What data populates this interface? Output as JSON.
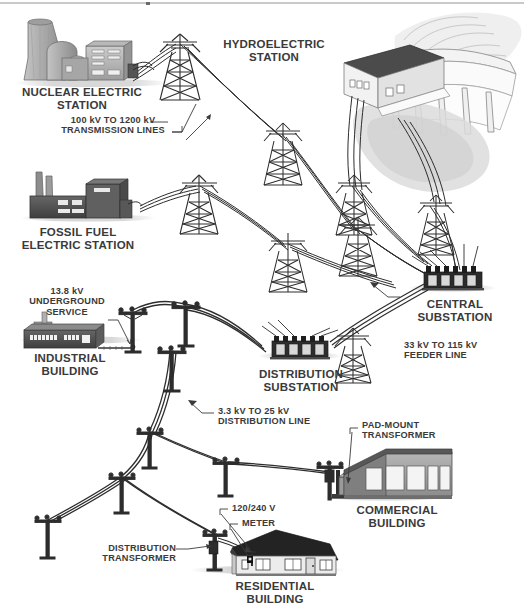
{
  "diagram": {
    "type": "schematic-illustration",
    "background_color": "#ffffff",
    "text_color": "#3a3a3a"
  },
  "labels": {
    "nuclear_station": "NUCLEAR ELECTRIC\nSTATION",
    "hydroelectric_station": "HYDROELECTRIC\nSTATION",
    "transmission_lines": "100 kV TO 1200 kV\nTRANSMISSION LINES",
    "fossil_fuel_station": "FOSSIL FUEL\nELECTRIC STATION",
    "underground_service": "13.8 kV\nUNDERGROUND\nSERVICE",
    "industrial_building": "INDUSTRIAL\nBUILDING",
    "central_substation": "CENTRAL\nSUBSTATION",
    "feeder_line": "33 kV TO 115 kV\nFEEDER LINE",
    "distribution_substation": "DISTRIBUTION\nSUBSTATION",
    "distribution_line": "3.3 kV TO 25 kV\nDISTRIBUTION LINE",
    "pad_mount_transformer": "PAD-MOUNT\nTRANSFORMER",
    "commercial_building": "COMMERCIAL\nBUILDING",
    "service_voltage": "120/240 V",
    "meter": "METER",
    "distribution_transformer": "DISTRIBUTION\nTRANSFORMER",
    "residential_building": "RESIDENTIAL\nBUILDING"
  },
  "voltages": [
    {
      "stage": "transmission",
      "range": "100 kV TO 1200 kV"
    },
    {
      "stage": "feeder",
      "range": "33 kV TO 115 kV"
    },
    {
      "stage": "distribution",
      "range": "3.3 kV TO 25 kV"
    },
    {
      "stage": "industrial-underground",
      "range": "13.8 kV"
    },
    {
      "stage": "residential-service",
      "range": "120/240 V"
    }
  ],
  "nodes": [
    {
      "name": "nuclear-electric-station",
      "kind": "generation"
    },
    {
      "name": "hydroelectric-station",
      "kind": "generation"
    },
    {
      "name": "fossil-fuel-electric-station",
      "kind": "generation"
    },
    {
      "name": "central-substation",
      "kind": "substation"
    },
    {
      "name": "distribution-substation",
      "kind": "substation"
    },
    {
      "name": "pad-mount-transformer",
      "kind": "transformer"
    },
    {
      "name": "distribution-transformer",
      "kind": "transformer"
    },
    {
      "name": "meter",
      "kind": "metering"
    },
    {
      "name": "industrial-building",
      "kind": "load"
    },
    {
      "name": "commercial-building",
      "kind": "load"
    },
    {
      "name": "residential-building",
      "kind": "load"
    }
  ]
}
